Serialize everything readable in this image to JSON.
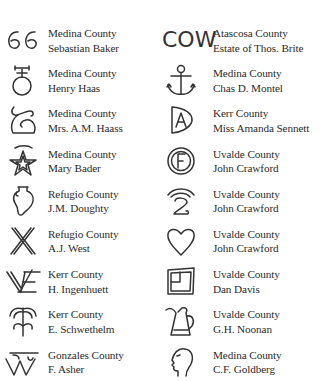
{
  "brands": {
    "left": [
      {
        "icon": "66-brand-icon",
        "glyph": "GG",
        "county": "Medina County",
        "owner": "Sebastian Baker"
      },
      {
        "icon": "venus-cross-brand-icon",
        "county": "Medina County",
        "owner": "Henry Haas"
      },
      {
        "icon": "looped-s-brand-icon",
        "county": "Medina County",
        "owner": "Mrs. A.M. Haass"
      },
      {
        "icon": "star-brand-icon",
        "county": "Medina County",
        "owner": "Mary Bader"
      },
      {
        "icon": "urn-brand-icon",
        "county": "Refugio County",
        "owner": "J.M. Doughty"
      },
      {
        "icon": "crossed-lines-brand-icon",
        "county": "Refugio County",
        "owner": "A.J. West"
      },
      {
        "icon": "ve-brand-icon",
        "county": "Kerr County",
        "owner": "H. Ingenhuett"
      },
      {
        "icon": "palm-brand-icon",
        "county": "Kerr County",
        "owner": "E. Schwethelm"
      },
      {
        "icon": "tw-brand-icon",
        "county": "Gonzales County",
        "owner": "F. Asher"
      }
    ],
    "right": [
      {
        "icon": "cow-brand-icon",
        "glyph": "COW",
        "county": "Atascosa County",
        "owner": "Estate of Thos. Brite"
      },
      {
        "icon": "anchor-brand-icon",
        "county": "Medina County",
        "owner": "Chas D. Montel"
      },
      {
        "icon": "a-in-shield-brand-icon",
        "county": "Kerr County",
        "owner": "Miss Amanda Sennett"
      },
      {
        "icon": "f-in-circle-brand-icon",
        "county": "Uvalde County",
        "owner": "John Crawford"
      },
      {
        "icon": "two-rainbow-brand-icon",
        "county": "Uvalde County",
        "owner": "John Crawford"
      },
      {
        "icon": "heart-brand-icon",
        "county": "Uvalde County",
        "owner": "John Crawford"
      },
      {
        "icon": "box-brand-icon",
        "county": "Uvalde County",
        "owner": "Dan Davis"
      },
      {
        "icon": "pitcher-brand-icon",
        "county": "Uvalde County",
        "owner": "G.H. Noonan"
      },
      {
        "icon": "head-brand-icon",
        "county": "Medina County",
        "owner": "C.F. Goldberg"
      }
    ]
  }
}
